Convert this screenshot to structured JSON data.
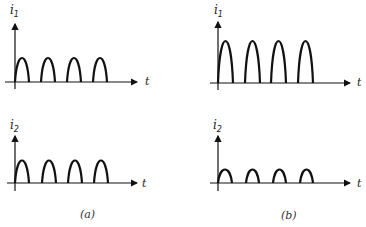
{
  "figure": {
    "panels": [
      {
        "caption": "(a)",
        "plots": [
          {
            "ylabel": "i",
            "ysub": "1",
            "xlabel": "t",
            "pulse_count": 4,
            "relative_amplitude": 1.0
          },
          {
            "ylabel": "i",
            "ysub": "2",
            "xlabel": "t",
            "pulse_count": 4,
            "relative_amplitude": 1.0
          }
        ]
      },
      {
        "caption": "(b)",
        "plots": [
          {
            "ylabel": "i",
            "ysub": "1",
            "xlabel": "t",
            "pulse_count": 4,
            "relative_amplitude": 1.8
          },
          {
            "ylabel": "i",
            "ysub": "2",
            "xlabel": "t",
            "pulse_count": 4,
            "relative_amplitude": 0.55
          }
        ]
      }
    ]
  }
}
